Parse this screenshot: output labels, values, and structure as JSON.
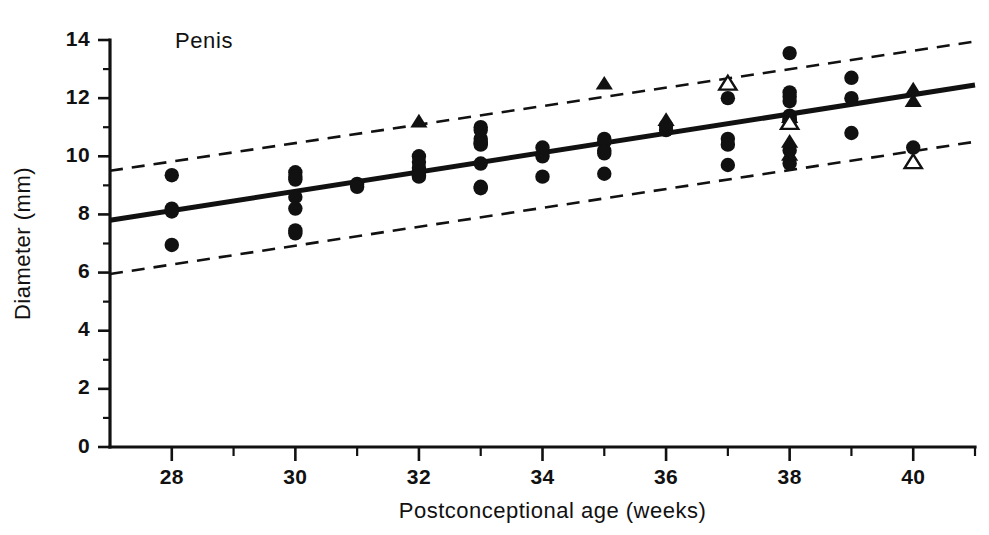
{
  "chart_data": {
    "type": "scatter",
    "title": "Penis",
    "xlabel": "Postconceptional age (weeks)",
    "ylabel": "Diameter (mm)",
    "xlim": [
      27,
      41
    ],
    "ylim": [
      0,
      14
    ],
    "x_ticks_major": [
      28,
      30,
      32,
      34,
      36,
      38,
      40
    ],
    "x_ticks_minor": [
      29,
      31,
      33,
      35,
      37,
      39
    ],
    "x_tick_labels": [
      "28",
      "30",
      "32",
      "34",
      "36",
      "38",
      "40"
    ],
    "y_ticks_major": [
      0,
      2,
      4,
      6,
      8,
      10,
      12,
      14
    ],
    "y_ticks_minor": [
      1,
      3,
      5,
      7,
      9,
      11,
      13
    ],
    "y_tick_labels": [
      "0",
      "2",
      "4",
      "6",
      "8",
      "10",
      "12",
      "14"
    ],
    "grid": false,
    "legend_position": "none",
    "regression_line": {
      "name": "Mean regression line",
      "x": [
        27,
        41
      ],
      "y": [
        7.8,
        12.45
      ],
      "style": "solid",
      "color": "#111111"
    },
    "prediction_bands": [
      {
        "name": "Upper limit (+2 SD)",
        "x": [
          27,
          41
        ],
        "y": [
          9.5,
          13.95
        ],
        "style": "dashed",
        "color": "#111111"
      },
      {
        "name": "Lower limit (-2 SD)",
        "x": [
          27,
          41
        ],
        "y": [
          5.95,
          10.5
        ],
        "style": "dashed",
        "color": "#111111"
      }
    ],
    "series": [
      {
        "name": "Filled circles",
        "marker": "circle-filled",
        "color": "#111111",
        "points": [
          [
            28,
            9.35
          ],
          [
            28,
            8.2
          ],
          [
            28,
            8.1
          ],
          [
            28,
            6.95
          ],
          [
            30,
            9.45
          ],
          [
            30,
            9.3
          ],
          [
            30,
            9.2
          ],
          [
            30,
            8.6
          ],
          [
            30,
            8.2
          ],
          [
            30,
            7.45
          ],
          [
            30,
            7.35
          ],
          [
            31,
            9.05
          ],
          [
            31,
            8.95
          ],
          [
            32,
            10.0
          ],
          [
            32,
            9.8
          ],
          [
            32,
            9.6
          ],
          [
            32,
            9.45
          ],
          [
            32,
            9.35
          ],
          [
            32,
            9.3
          ],
          [
            33,
            11.0
          ],
          [
            33,
            10.9
          ],
          [
            33,
            10.6
          ],
          [
            33,
            10.5
          ],
          [
            33,
            10.45
          ],
          [
            33,
            10.4
          ],
          [
            33,
            9.75
          ],
          [
            33,
            8.95
          ],
          [
            33,
            8.9
          ],
          [
            34,
            10.3
          ],
          [
            34,
            10.0
          ],
          [
            34,
            9.3
          ],
          [
            35,
            10.6
          ],
          [
            35,
            10.5
          ],
          [
            35,
            10.2
          ],
          [
            35,
            10.1
          ],
          [
            35,
            9.4
          ],
          [
            36,
            11.05
          ],
          [
            36,
            10.9
          ],
          [
            37,
            12.0
          ],
          [
            37,
            10.6
          ],
          [
            37,
            10.4
          ],
          [
            37,
            9.7
          ],
          [
            38,
            13.55
          ],
          [
            38,
            12.2
          ],
          [
            38,
            12.05
          ],
          [
            38,
            11.9
          ],
          [
            38,
            11.4
          ],
          [
            38,
            11.3
          ],
          [
            38,
            11.25
          ],
          [
            38,
            11.2
          ],
          [
            38,
            10.2
          ],
          [
            38,
            9.75
          ],
          [
            39,
            12.7
          ],
          [
            39,
            12.0
          ],
          [
            39,
            10.8
          ],
          [
            40,
            10.3
          ]
        ]
      },
      {
        "name": "Filled triangles",
        "marker": "triangle-filled",
        "color": "#111111",
        "points": [
          [
            32,
            11.2
          ],
          [
            35,
            12.5
          ],
          [
            36,
            11.25
          ],
          [
            38,
            11.35
          ],
          [
            38,
            10.5
          ],
          [
            38,
            10.05
          ],
          [
            40,
            12.3
          ],
          [
            40,
            11.9
          ]
        ]
      },
      {
        "name": "Open triangles",
        "marker": "triangle-open",
        "color": "#111111",
        "points": [
          [
            37,
            12.5
          ],
          [
            38,
            11.15
          ],
          [
            40,
            9.8
          ]
        ]
      }
    ]
  },
  "figure": {
    "background_color": "#ffffff",
    "foreground_color": "#111111"
  }
}
